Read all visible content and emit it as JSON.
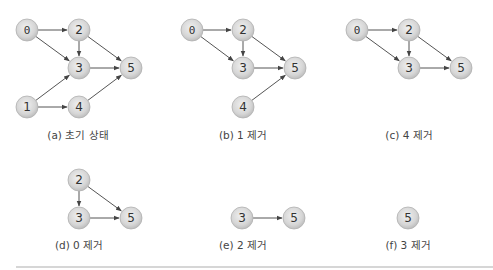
{
  "figure": {
    "node_radius": 11,
    "colors": {
      "node_center": "#eeeeee",
      "node_edge": "#bdbdbd",
      "node_border": "#b0b0b0",
      "edge": "#555555",
      "divider": "#c8c8c8"
    },
    "panels": [
      {
        "id": "a",
        "caption": "(a) 초기 상태",
        "caption_pos": [
          78,
          139
        ],
        "nodes": [
          {
            "label": "0",
            "x": 27,
            "y": 30,
            "mono": true
          },
          {
            "label": "2",
            "x": 79,
            "y": 30
          },
          {
            "label": "3",
            "x": 79,
            "y": 68
          },
          {
            "label": "5",
            "x": 131,
            "y": 68
          },
          {
            "label": "1",
            "x": 27,
            "y": 107
          },
          {
            "label": "4",
            "x": 79,
            "y": 107
          }
        ],
        "edges": [
          [
            "0",
            "2"
          ],
          [
            "0",
            "3"
          ],
          [
            "2",
            "3"
          ],
          [
            "2",
            "5"
          ],
          [
            "3",
            "5"
          ],
          [
            "1",
            "3"
          ],
          [
            "1",
            "4"
          ],
          [
            "4",
            "5"
          ]
        ]
      },
      {
        "id": "b",
        "caption": "(b) 1 제거",
        "caption_pos": [
          243,
          139
        ],
        "nodes": [
          {
            "label": "0",
            "x": 192,
            "y": 30,
            "mono": true
          },
          {
            "label": "2",
            "x": 243,
            "y": 30
          },
          {
            "label": "3",
            "x": 243,
            "y": 68
          },
          {
            "label": "5",
            "x": 295,
            "y": 68
          },
          {
            "label": "4",
            "x": 243,
            "y": 107
          }
        ],
        "edges": [
          [
            "0",
            "2"
          ],
          [
            "0",
            "3"
          ],
          [
            "2",
            "3"
          ],
          [
            "2",
            "5"
          ],
          [
            "3",
            "5"
          ],
          [
            "4",
            "5"
          ]
        ]
      },
      {
        "id": "c",
        "caption": "(c) 4 제거",
        "caption_pos": [
          409,
          139
        ],
        "nodes": [
          {
            "label": "0",
            "x": 357,
            "y": 30,
            "mono": true
          },
          {
            "label": "2",
            "x": 409,
            "y": 30
          },
          {
            "label": "3",
            "x": 409,
            "y": 68
          },
          {
            "label": "5",
            "x": 461,
            "y": 68
          }
        ],
        "edges": [
          [
            "0",
            "2"
          ],
          [
            "0",
            "3"
          ],
          [
            "2",
            "3"
          ],
          [
            "2",
            "5"
          ],
          [
            "3",
            "5"
          ]
        ]
      },
      {
        "id": "d",
        "caption": "(d) 0 제거",
        "caption_pos": [
          79,
          249
        ],
        "nodes": [
          {
            "label": "2",
            "x": 79,
            "y": 180
          },
          {
            "label": "3",
            "x": 79,
            "y": 218
          },
          {
            "label": "5",
            "x": 131,
            "y": 218
          }
        ],
        "edges": [
          [
            "2",
            "3"
          ],
          [
            "2",
            "5"
          ],
          [
            "3",
            "5"
          ]
        ]
      },
      {
        "id": "e",
        "caption": "(e) 2 제거",
        "caption_pos": [
          243,
          249
        ],
        "nodes": [
          {
            "label": "3",
            "x": 242,
            "y": 218
          },
          {
            "label": "5",
            "x": 294,
            "y": 218
          }
        ],
        "edges": [
          [
            "3",
            "5"
          ]
        ]
      },
      {
        "id": "f",
        "caption": "(f) 3 제거",
        "caption_pos": [
          408,
          249
        ],
        "nodes": [
          {
            "label": "5",
            "x": 408,
            "y": 218
          }
        ],
        "edges": []
      }
    ],
    "divider": {
      "x1": 16,
      "x2": 493,
      "y": 267
    }
  }
}
